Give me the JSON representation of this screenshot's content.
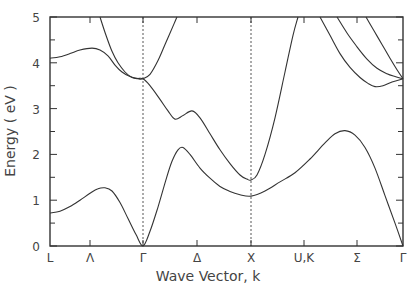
{
  "chart_data": {
    "type": "line",
    "title": "",
    "xlabel": "Wave Vector, k",
    "ylabel": "Energy ( eV )",
    "ylim": [
      0,
      5
    ],
    "yticks": [
      0,
      1,
      2,
      3,
      4,
      5
    ],
    "yticks_minor_step": 0.5,
    "grid": false,
    "legend": null,
    "x_symmetry_points": [
      {
        "label": "L",
        "k": 0
      },
      {
        "label": "Λ",
        "k": 40
      },
      {
        "label": "Γ",
        "k": 93
      },
      {
        "label": "Δ",
        "k": 147
      },
      {
        "label": "X",
        "k": 201
      },
      {
        "label": "U,K",
        "k": 254
      },
      {
        "label": "Σ",
        "k": 307
      },
      {
        "label": "Γ",
        "k": 353
      }
    ],
    "dotted_vertical_lines_at": [
      "Γ",
      "X"
    ],
    "xlim": [
      0,
      353
    ],
    "series": [
      {
        "name": "band-1 (valence/lowest)",
        "points": [
          [
            0,
            0.72
          ],
          [
            10,
            0.76
          ],
          [
            20,
            0.86
          ],
          [
            30,
            1.0
          ],
          [
            40,
            1.15
          ],
          [
            48,
            1.25
          ],
          [
            55,
            1.27
          ],
          [
            62,
            1.2
          ],
          [
            70,
            0.95
          ],
          [
            78,
            0.6
          ],
          [
            86,
            0.25
          ],
          [
            93,
            0.0
          ],
          [
            100,
            0.32
          ],
          [
            108,
            0.85
          ],
          [
            116,
            1.45
          ],
          [
            122,
            1.85
          ],
          [
            128,
            2.1
          ],
          [
            133,
            2.15
          ],
          [
            140,
            2.0
          ],
          [
            150,
            1.7
          ],
          [
            160,
            1.48
          ],
          [
            170,
            1.3
          ],
          [
            180,
            1.19
          ],
          [
            190,
            1.12
          ],
          [
            201,
            1.09
          ],
          [
            215,
            1.2
          ],
          [
            230,
            1.4
          ],
          [
            245,
            1.6
          ],
          [
            260,
            1.9
          ],
          [
            275,
            2.25
          ],
          [
            285,
            2.45
          ],
          [
            295,
            2.52
          ],
          [
            305,
            2.42
          ],
          [
            315,
            2.15
          ],
          [
            325,
            1.7
          ],
          [
            335,
            1.1
          ],
          [
            345,
            0.5
          ],
          [
            353,
            0.0
          ]
        ]
      },
      {
        "name": "band-2",
        "points": [
          [
            0,
            4.1
          ],
          [
            10,
            4.13
          ],
          [
            20,
            4.2
          ],
          [
            30,
            4.28
          ],
          [
            42,
            4.32
          ],
          [
            50,
            4.28
          ],
          [
            58,
            4.15
          ],
          [
            65,
            3.95
          ],
          [
            72,
            3.8
          ],
          [
            80,
            3.7
          ],
          [
            87,
            3.66
          ],
          [
            93,
            3.65
          ],
          [
            100,
            3.5
          ],
          [
            110,
            3.2
          ],
          [
            118,
            2.95
          ],
          [
            125,
            2.77
          ],
          [
            133,
            2.85
          ],
          [
            142,
            2.95
          ],
          [
            150,
            2.8
          ],
          [
            160,
            2.45
          ],
          [
            170,
            2.1
          ],
          [
            180,
            1.8
          ],
          [
            190,
            1.55
          ],
          [
            197,
            1.46
          ],
          [
            201,
            1.44
          ],
          [
            207,
            1.55
          ],
          [
            215,
            2.0
          ],
          [
            225,
            2.8
          ],
          [
            235,
            3.8
          ],
          [
            243,
            4.6
          ],
          [
            248,
            5.0
          ]
        ]
      },
      {
        "name": "band-3 (steep from top to Γ)",
        "points": [
          [
            50,
            5.0
          ],
          [
            56,
            4.6
          ],
          [
            62,
            4.25
          ],
          [
            68,
            4.0
          ],
          [
            75,
            3.8
          ],
          [
            82,
            3.68
          ],
          [
            88,
            3.65
          ],
          [
            93,
            3.65
          ],
          [
            100,
            3.75
          ],
          [
            108,
            4.05
          ],
          [
            116,
            4.45
          ],
          [
            124,
            4.85
          ],
          [
            127,
            5.0
          ]
        ]
      },
      {
        "name": "band-4 (Σ, lowest of three)",
        "points": [
          [
            270,
            5.0
          ],
          [
            280,
            4.6
          ],
          [
            290,
            4.2
          ],
          [
            300,
            3.9
          ],
          [
            310,
            3.68
          ],
          [
            318,
            3.55
          ],
          [
            325,
            3.48
          ],
          [
            333,
            3.5
          ],
          [
            342,
            3.58
          ],
          [
            353,
            3.65
          ]
        ]
      },
      {
        "name": "band-5 (Σ, middle)",
        "points": [
          [
            287,
            5.0
          ],
          [
            297,
            4.65
          ],
          [
            307,
            4.35
          ],
          [
            317,
            4.08
          ],
          [
            327,
            3.88
          ],
          [
            337,
            3.76
          ],
          [
            345,
            3.7
          ],
          [
            353,
            3.65
          ]
        ]
      },
      {
        "name": "band-6 (Σ, upper)",
        "points": [
          [
            316,
            5.0
          ],
          [
            324,
            4.7
          ],
          [
            332,
            4.4
          ],
          [
            340,
            4.1
          ],
          [
            347,
            3.85
          ],
          [
            353,
            3.65
          ]
        ]
      }
    ]
  },
  "axes": {
    "y_title": "Energy ( eV )",
    "x_title": "Wave Vector, k",
    "y_tick_labels": [
      "0",
      "1",
      "2",
      "3",
      "4",
      "5"
    ],
    "x_tick_labels": [
      "L",
      "Λ",
      "Γ",
      "Δ",
      "X",
      "U,K",
      "Σ",
      "Γ"
    ]
  }
}
